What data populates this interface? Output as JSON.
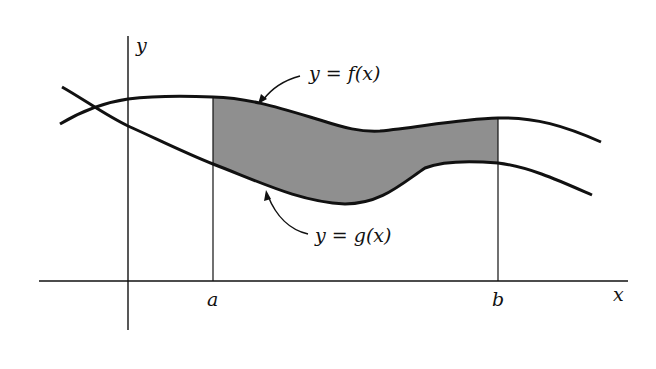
{
  "figure": {
    "labels": {
      "y_axis": "y",
      "x_axis": "x",
      "a": "a",
      "b": "b",
      "f_curve": "y = f(x)",
      "g_curve": "y = g(x)"
    },
    "colors": {
      "ink": "#111111",
      "shade": "#8f8f8f",
      "background": "#ffffff"
    }
  }
}
